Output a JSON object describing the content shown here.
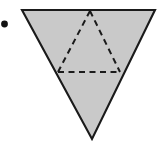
{
  "figure": {
    "type": "geometry-diagram",
    "subject": "tetrahedron",
    "description": "Shaded inverted triangle representing a tetrahedron viewed from above, with dashed hidden edges forming an upright inner triangle",
    "caption": "",
    "background_color": "#ffffff",
    "fill_color": "#c9c9c9",
    "outline_color": "#1a1a1a",
    "dashed_color": "#1a1a1a",
    "bullet": {
      "name": "list-bullet",
      "shape": "filled-circle",
      "color": "#111111",
      "cx": 4.5,
      "cy": 24,
      "r": 3.4
    },
    "solid_triangle": {
      "name": "outer-triangle",
      "orientation": "point-down",
      "points": "22,10 155,10 92,139",
      "stroke_width": 2.1,
      "vertices": [
        {
          "label": "top-left",
          "x": 22,
          "y": 10
        },
        {
          "label": "top-right",
          "x": 155,
          "y": 10
        },
        {
          "label": "bottom-apex",
          "x": 92,
          "y": 139
        }
      ]
    },
    "dashed_triangle": {
      "name": "hidden-edge-triangle",
      "orientation": "point-up",
      "points": "90,11 58,72 120,72",
      "stroke_width": 2.0,
      "dash_pattern": "6,4.5",
      "vertices": [
        {
          "label": "apex",
          "x": 90,
          "y": 11
        },
        {
          "label": "left",
          "x": 58,
          "y": 72
        },
        {
          "label": "right",
          "x": 120,
          "y": 72
        }
      ],
      "edges": [
        {
          "name": "hidden-edge-left",
          "from": "90,11",
          "to": "58,72"
        },
        {
          "name": "hidden-edge-right",
          "from": "90,11",
          "to": "120,72"
        },
        {
          "name": "hidden-edge-base",
          "from": "58,72",
          "to": "120,72"
        }
      ]
    },
    "labels": []
  }
}
